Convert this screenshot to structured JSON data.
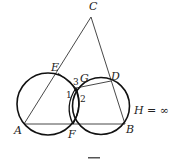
{
  "figure": {
    "labels": {
      "A": "A",
      "B": "B",
      "C": "C",
      "D": "D",
      "E": "E",
      "F": "F",
      "G": "G",
      "H": "H = ∞"
    },
    "angles": {
      "one": "1",
      "two": "2",
      "three": "3"
    },
    "caption_partial": "图"
  }
}
